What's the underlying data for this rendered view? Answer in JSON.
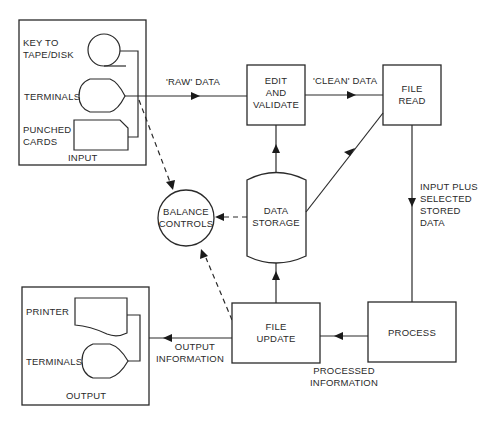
{
  "diagram": {
    "type": "data-processing-flowchart",
    "colors": {
      "line": "#2a2a2a",
      "background": "#ffffff"
    },
    "input_group": {
      "label": "INPUT",
      "devices": [
        {
          "label_line1": "KEY TO",
          "label_line2": "TAPE/DISK",
          "shape": "tape-reel"
        },
        {
          "label": "TERMINALS",
          "shape": "display-terminal"
        },
        {
          "label_line1": "PUNCHED",
          "label_line2": "CARDS",
          "shape": "punched-card"
        }
      ]
    },
    "output_group": {
      "label": "OUTPUT",
      "devices": [
        {
          "label": "PRINTER",
          "shape": "document"
        },
        {
          "label": "TERMINALS",
          "shape": "display-terminal"
        }
      ]
    },
    "nodes": {
      "edit": {
        "line1": "EDIT",
        "line2": "AND",
        "line3": "VALIDATE"
      },
      "file_read": {
        "line1": "FILE",
        "line2": "READ"
      },
      "data_storage": {
        "line1": "DATA",
        "line2": "STORAGE"
      },
      "balance": {
        "line1": "BALANCE",
        "line2": "CONTROLS"
      },
      "file_update": {
        "line1": "FILE",
        "line2": "UPDATE"
      },
      "process": {
        "label": "PROCESS"
      }
    },
    "edges": {
      "raw_data": "'RAW' DATA",
      "clean_data": "'CLEAN' DATA",
      "input_plus": {
        "line1": "INPUT PLUS",
        "line2": "SELECTED",
        "line3": "STORED",
        "line4": "DATA"
      },
      "processed": {
        "line1": "PROCESSED",
        "line2": "INFORMATION"
      },
      "output_info": {
        "line1": "OUTPUT",
        "line2": "INFORMATION"
      }
    }
  }
}
